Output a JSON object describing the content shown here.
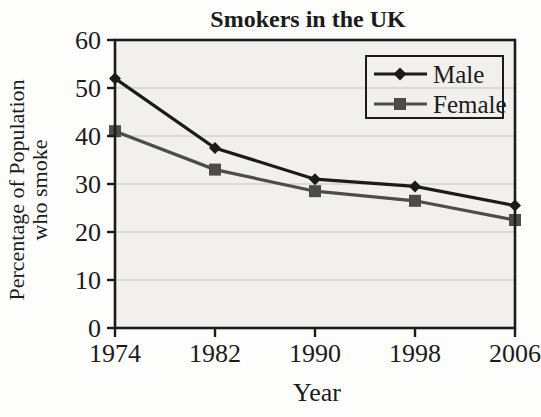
{
  "figure": {
    "background": "#fdfdfc"
  },
  "chart_data": {
    "type": "line",
    "title": "Smokers in the UK",
    "xlabel": "Year",
    "ylabel": "Percentage of Population who smoke",
    "ylabel_lines": [
      "Percentage of Population",
      "who smoke"
    ],
    "categories": [
      "1974",
      "1982",
      "1990",
      "1998",
      "2006"
    ],
    "series": [
      {
        "name": "Male",
        "marker": "diamond",
        "color": "#1b1b1b",
        "values": [
          52,
          37.5,
          31,
          29.5,
          25.5
        ]
      },
      {
        "name": "Female",
        "marker": "square",
        "color": "#4e4b48",
        "values": [
          41,
          33,
          28.5,
          26.5,
          22.5
        ]
      }
    ],
    "ylim": [
      0,
      60
    ],
    "yticks": [
      0,
      10,
      20,
      30,
      40,
      50,
      60
    ],
    "grid": "horizontal",
    "legend_position": "top-right-inside",
    "colors": {
      "plot_bg": "#f2f0ec",
      "grid": "#c4c1bc",
      "axis": "#1b1b1b"
    }
  }
}
